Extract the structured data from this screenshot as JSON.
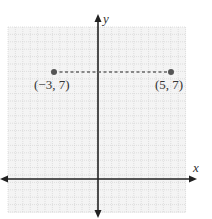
{
  "chart_data": {
    "type": "scatter",
    "title": "",
    "xlabel": "x",
    "ylabel": "y",
    "xlim": [
      -6,
      6
    ],
    "ylim": [
      -2,
      10
    ],
    "grid": true,
    "tick_labels": false,
    "points": [
      {
        "x": -3,
        "y": 7,
        "label": "(−3, 7)"
      },
      {
        "x": 5,
        "y": 7,
        "label": "(5, 7)"
      }
    ],
    "segments": [
      {
        "from": [
          -3,
          7
        ],
        "to": [
          5,
          7
        ],
        "style": "dashed"
      }
    ],
    "colors": {
      "grid": "#c8c8c8",
      "grid_bg": "#f2f2f2",
      "axis": "#222222",
      "point": "#555555",
      "dashed_line": "#666666"
    }
  }
}
